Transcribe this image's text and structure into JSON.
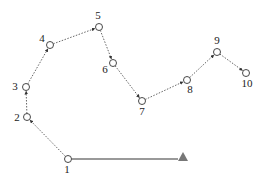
{
  "diagram": {
    "type": "path-with-waypoints",
    "colors": {
      "node_stroke": "#333333",
      "dotted": "#555555",
      "solid": "#777777",
      "triangle": "#777777"
    },
    "nodes": [
      {
        "id": "1",
        "label": "1",
        "x": 68,
        "y": 159,
        "lx": 67,
        "ly": 173,
        "anchor": "middle"
      },
      {
        "id": "2",
        "label": "2",
        "x": 27,
        "y": 117,
        "lx": 17,
        "ly": 121,
        "anchor": "middle"
      },
      {
        "id": "3",
        "label": "3",
        "x": 26,
        "y": 87,
        "lx": 15,
        "ly": 90,
        "anchor": "middle"
      },
      {
        "id": "4",
        "label": "4",
        "x": 50,
        "y": 45,
        "lx": 42,
        "ly": 42,
        "anchor": "middle"
      },
      {
        "id": "5",
        "label": "5",
        "x": 99,
        "y": 27,
        "lx": 98,
        "ly": 19,
        "anchor": "middle"
      },
      {
        "id": "6",
        "label": "6",
        "x": 113,
        "y": 63,
        "lx": 105,
        "ly": 73,
        "anchor": "middle"
      },
      {
        "id": "7",
        "label": "7",
        "x": 142,
        "y": 101,
        "lx": 142,
        "ly": 115,
        "anchor": "middle"
      },
      {
        "id": "8",
        "label": "8",
        "x": 187,
        "y": 80,
        "lx": 190,
        "ly": 93,
        "anchor": "middle"
      },
      {
        "id": "9",
        "label": "9",
        "x": 217,
        "y": 52,
        "lx": 217,
        "ly": 44,
        "anchor": "middle"
      },
      {
        "id": "10",
        "label": "10",
        "x": 246,
        "y": 73,
        "lx": 247,
        "ly": 87,
        "anchor": "middle"
      }
    ],
    "goal": {
      "shape": "triangle",
      "x": 183,
      "y": 157
    },
    "solid_edge": {
      "from": "1",
      "to": "goal"
    },
    "dotted_edges": [
      [
        "1",
        "2"
      ],
      [
        "2",
        "3"
      ],
      [
        "3",
        "4"
      ],
      [
        "4",
        "5"
      ],
      [
        "5",
        "6"
      ],
      [
        "6",
        "7"
      ],
      [
        "7",
        "8"
      ],
      [
        "8",
        "9"
      ],
      [
        "9",
        "10"
      ]
    ]
  }
}
